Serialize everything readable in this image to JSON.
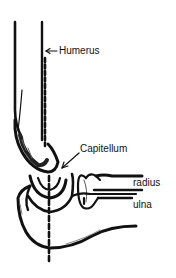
{
  "diagram": {
    "labels": {
      "humerus": "Humerus",
      "capitellum": "Capitellum",
      "radius": "radius",
      "ulna": "ulna"
    },
    "colors": {
      "ink": "#111111",
      "background": "#ffffff"
    }
  }
}
